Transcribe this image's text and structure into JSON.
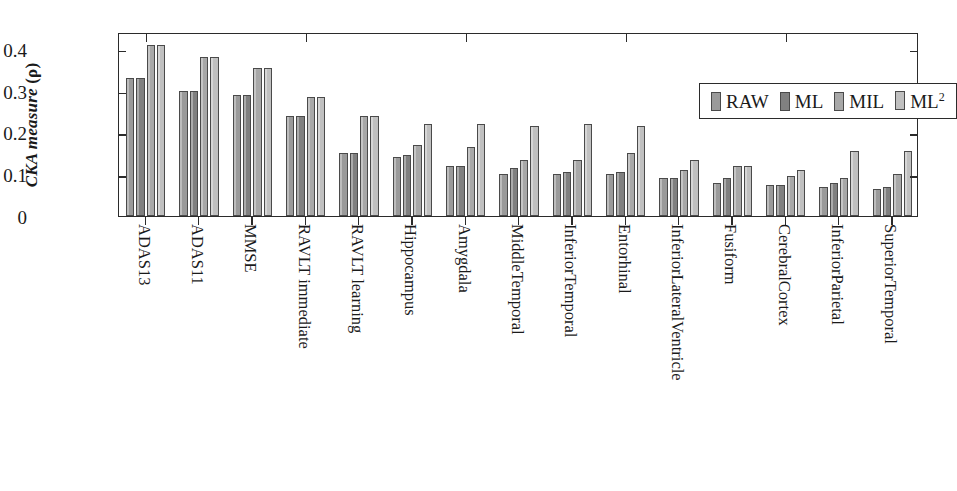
{
  "chart_data": {
    "type": "bar",
    "title": "",
    "xlabel": "",
    "ylabel": "CKA measure (ρ)",
    "ylabel_italic_part": "CKA measure",
    "ylabel_paren_part": "(ρ)",
    "ylim": [
      0,
      0.44
    ],
    "yticks": [
      0,
      0.1,
      0.2,
      0.3,
      0.4
    ],
    "ytick_labels": [
      "0",
      "0.1",
      "0.2",
      "0.3",
      "0.4"
    ],
    "grid": false,
    "legend_position": "top-right",
    "categories": [
      "ADAS13",
      "ADAS11",
      "MMSE",
      "RAVLT immediate",
      "RAVLT learning",
      "Hippocampus",
      "Amygdala",
      "MiddleTemporal",
      "InferiorTemporal",
      "Entorhinal",
      "InferiorLateralVentricle",
      "Fusiform",
      "CerebralCortex",
      "InferiorParietal",
      "SuperiorTemporal"
    ],
    "series": [
      {
        "name": "RAW",
        "color": "#9a9a9a",
        "values": [
          0.33,
          0.3,
          0.29,
          0.24,
          0.15,
          0.14,
          0.12,
          0.1,
          0.1,
          0.1,
          0.09,
          0.08,
          0.075,
          0.07,
          0.065
        ]
      },
      {
        "name": "ML",
        "color": "#808080",
        "values": [
          0.33,
          0.3,
          0.29,
          0.24,
          0.15,
          0.145,
          0.12,
          0.115,
          0.105,
          0.105,
          0.09,
          0.09,
          0.075,
          0.08,
          0.07
        ]
      },
      {
        "name": "MIL",
        "color": "#a8a8a8",
        "values": [
          0.41,
          0.38,
          0.355,
          0.285,
          0.24,
          0.17,
          0.165,
          0.135,
          0.135,
          0.15,
          0.11,
          0.12,
          0.095,
          0.09,
          0.1
        ]
      },
      {
        "name": "ML²",
        "color": "#c0c0c0",
        "values": [
          0.41,
          0.38,
          0.355,
          0.285,
          0.24,
          0.22,
          0.22,
          0.215,
          0.22,
          0.215,
          0.135,
          0.12,
          0.11,
          0.155,
          0.155
        ]
      }
    ],
    "legend": [
      {
        "label": "RAW",
        "sup": "",
        "color": "#9a9a9a"
      },
      {
        "label": "ML",
        "sup": "",
        "color": "#808080"
      },
      {
        "label": "MIL",
        "sup": "",
        "color": "#a8a8a8"
      },
      {
        "label": "ML",
        "sup": "2",
        "color": "#c0c0c0"
      }
    ]
  }
}
